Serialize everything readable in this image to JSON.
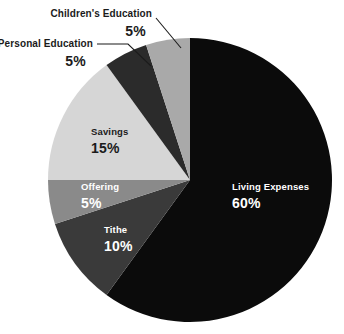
{
  "chart_data": {
    "type": "pie",
    "title": "",
    "subtitle": "",
    "xlabel": "",
    "ylabel": "",
    "legend_position": "none",
    "grid": false,
    "unit": "%",
    "total": 100,
    "start_angle_deg": 0,
    "direction": "clockwise",
    "categories": [
      "Living Expenses",
      "Tithe",
      "Offering",
      "Savings",
      "Personal Education",
      "Children's Education"
    ],
    "values": [
      60,
      10,
      5,
      15,
      5,
      5
    ],
    "value_labels": [
      "60%",
      "10%",
      "5%",
      "15%",
      "5%",
      "5%"
    ],
    "colors": [
      "#0b0b0b",
      "#3a3a3a",
      "#8a8a8a",
      "#d6d6d6",
      "#2b2b2b",
      "#a9a9a9"
    ],
    "slices": [
      {
        "label": "Living Expenses",
        "value": 60,
        "value_label": "60%",
        "color": "#0b0b0b",
        "text_color": "#ffffff",
        "label_placement": "inside"
      },
      {
        "label": "Tithe",
        "value": 10,
        "value_label": "10%",
        "color": "#3a3a3a",
        "text_color": "#ffffff",
        "label_placement": "inside"
      },
      {
        "label": "Offering",
        "value": 5,
        "value_label": "5%",
        "color": "#8a8a8a",
        "text_color": "#ffffff",
        "label_placement": "inside"
      },
      {
        "label": "Savings",
        "value": 15,
        "value_label": "15%",
        "color": "#d6d6d6",
        "text_color": "#1b1b1b",
        "label_placement": "inside"
      },
      {
        "label": "Personal Education",
        "value": 5,
        "value_label": "5%",
        "color": "#2b2b2b",
        "text_color": "#1b1b1b",
        "label_placement": "outside-left"
      },
      {
        "label": "Children's Education",
        "value": 5,
        "value_label": "5%",
        "color": "#a9a9a9",
        "text_color": "#1b1b1b",
        "label_placement": "outside-top"
      }
    ]
  },
  "canvas": {
    "background": "#ffffff"
  }
}
